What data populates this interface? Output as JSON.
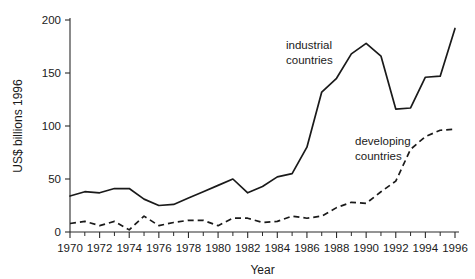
{
  "chart_data": {
    "type": "line",
    "title": "",
    "subtitle": "",
    "xlabel": "Year",
    "ylabel": "US$ billions 1996",
    "xlim": [
      1970,
      1996
    ],
    "ylim": [
      0,
      200
    ],
    "grid": false,
    "legend_position": "inline-annotations",
    "x_ticks": [
      1970,
      1972,
      1974,
      1976,
      1978,
      1980,
      1982,
      1984,
      1986,
      1988,
      1990,
      1992,
      1994,
      1996
    ],
    "x_tick_labels": [
      "1970",
      "1972",
      "1974",
      "1976",
      "1978",
      "1980",
      "1982",
      "1984",
      "1986",
      "1988",
      "1990",
      "1992",
      "1994",
      "1996"
    ],
    "x_minor_tick_interval": 1,
    "y_ticks": [
      0,
      50,
      100,
      150,
      200
    ],
    "y_tick_labels": [
      "0",
      "50",
      "100",
      "150",
      "200"
    ],
    "x": [
      1970,
      1971,
      1972,
      1973,
      1974,
      1975,
      1976,
      1977,
      1978,
      1979,
      1980,
      1981,
      1982,
      1983,
      1984,
      1985,
      1986,
      1987,
      1988,
      1989,
      1990,
      1991,
      1992,
      1993,
      1994,
      1995,
      1996
    ],
    "series": [
      {
        "name": "industrial countries",
        "style": "solid",
        "color": "#1a1a1a",
        "annotation_label": "industrial\ncountries",
        "values": [
          34,
          38,
          37,
          41,
          41,
          31,
          25,
          26,
          32,
          38,
          44,
          50,
          37,
          43,
          52,
          55,
          80,
          132,
          145,
          168,
          178,
          166,
          116,
          117,
          146,
          147,
          192
        ]
      },
      {
        "name": "developing countries",
        "style": "dashed",
        "color": "#1a1a1a",
        "annotation_label": "developing\ncountries",
        "values": [
          8,
          10,
          6,
          10,
          2,
          15,
          6,
          9,
          11,
          11,
          6,
          13,
          13,
          9,
          10,
          15,
          13,
          15,
          23,
          28,
          27,
          38,
          48,
          78,
          90,
          96,
          97
        ]
      }
    ],
    "annotations": [
      {
        "name": "industrial-countries-label",
        "lines": [
          "industrial",
          "countries"
        ],
        "x_px": 286,
        "y_px": 49
      },
      {
        "name": "developing-countries-label",
        "lines": [
          "developing",
          "countries"
        ],
        "x_px": 355,
        "y_px": 145
      }
    ]
  }
}
